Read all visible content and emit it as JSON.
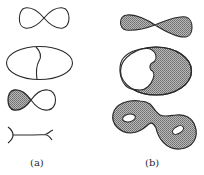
{
  "figure": {
    "colors": {
      "stroke": "#2a2a2a",
      "shade": "#9a9a9a",
      "background": "#ffffff"
    },
    "panels": [
      {
        "label": "(a)",
        "items": [
          "figure-eight curve",
          "ellipse with wavy vertical divider",
          "figure-eight curve with left lobe shaded",
          "line segment with forked ends"
        ]
      },
      {
        "label": "(b)",
        "items": [
          "shaded figure-eight (pinched disc)",
          "ellipse with unshaded region carved on left",
          "shaded genus-2 surface with two holes"
        ]
      }
    ]
  }
}
